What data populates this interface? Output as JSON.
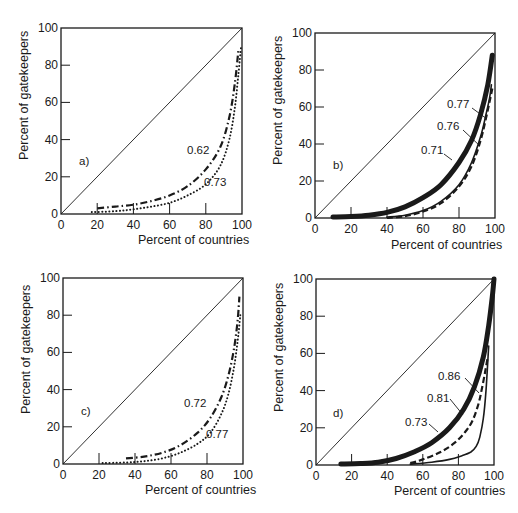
{
  "chart_data": [
    {
      "type": "line",
      "panel_label": "a)",
      "xlabel": "Percent of countries",
      "ylabel": "Percent of gatekeepers",
      "xlim": [
        0,
        100
      ],
      "ylim": [
        0,
        100
      ],
      "xticks": [
        "0",
        "20",
        "40",
        "60",
        "80",
        "100"
      ],
      "yticks": [
        "0",
        "20",
        "40",
        "60",
        "80",
        "100"
      ],
      "grid": false,
      "reference_line": "diagonal y = x (line of equality)",
      "series": [
        {
          "name": "0.62",
          "style": "dash-dot",
          "x": [
            20,
            30,
            40,
            50,
            60,
            70,
            80,
            88,
            93,
            96,
            98
          ],
          "y": [
            3,
            4,
            5,
            7,
            10,
            15,
            24,
            36,
            52,
            70,
            88
          ]
        },
        {
          "name": "0.73",
          "style": "dotted",
          "x": [
            17,
            30,
            40,
            50,
            60,
            70,
            80,
            88,
            93,
            96,
            98,
            99.5
          ],
          "y": [
            1,
            1.5,
            2.5,
            4,
            6,
            10,
            16,
            26,
            40,
            57,
            75,
            90
          ]
        }
      ]
    },
    {
      "type": "line",
      "panel_label": "b)",
      "xlabel": "Percent of countries",
      "ylabel": "Percent of gatekeepers",
      "xlim": [
        0,
        100
      ],
      "ylim": [
        0,
        100
      ],
      "xticks": [
        "0",
        "20",
        "40",
        "60",
        "80",
        "100"
      ],
      "yticks": [
        "0",
        "20",
        "40",
        "60",
        "80",
        "100"
      ],
      "grid": false,
      "reference_line": "diagonal y = x (line of equality)",
      "series": [
        {
          "name": "0.71",
          "style": "thick-solid",
          "x": [
            10,
            20,
            30,
            40,
            50,
            60,
            70,
            80,
            87,
            92,
            96,
            98.5
          ],
          "y": [
            0.5,
            0.8,
            1.5,
            3,
            6,
            11,
            18,
            30,
            42,
            56,
            72,
            88
          ]
        },
        {
          "name": "0.76",
          "style": "thin-solid",
          "x": [
            40,
            50,
            60,
            70,
            80,
            87,
            92,
            95,
            97,
            98
          ],
          "y": [
            0.5,
            1.5,
            4,
            9,
            18,
            30,
            44,
            56,
            65,
            72
          ]
        },
        {
          "name": "0.77",
          "style": "dashed",
          "x": [
            40,
            50,
            60,
            70,
            80,
            87,
            92,
            95,
            97,
            98.5
          ],
          "y": [
            0,
            1,
            3.5,
            8,
            17,
            28,
            42,
            54,
            63,
            70
          ]
        }
      ]
    },
    {
      "type": "line",
      "panel_label": "c)",
      "xlabel": "Percent of countries",
      "ylabel": "Percent of gatekeepers",
      "xlim": [
        0,
        100
      ],
      "ylim": [
        0,
        100
      ],
      "xticks": [
        "0",
        "20",
        "40",
        "60",
        "80",
        "100"
      ],
      "yticks": [
        "0",
        "20",
        "40",
        "60",
        "80",
        "100"
      ],
      "grid": false,
      "reference_line": "diagonal y = x (line of equality)",
      "series": [
        {
          "name": "0.72",
          "style": "dash-dot",
          "x": [
            35,
            45,
            55,
            65,
            75,
            82,
            88,
            92,
            95,
            97,
            98
          ],
          "y": [
            3,
            4,
            6,
            10,
            17,
            25,
            36,
            48,
            62,
            77,
            90
          ]
        },
        {
          "name": "0.77",
          "style": "dotted",
          "x": [
            22,
            35,
            45,
            55,
            65,
            75,
            82,
            88,
            92,
            95,
            97,
            98.5
          ],
          "y": [
            0.5,
            0.8,
            1.5,
            3,
            6,
            11,
            17,
            27,
            38,
            52,
            66,
            80
          ]
        }
      ]
    },
    {
      "type": "line",
      "panel_label": "d)",
      "xlabel": "Percent of countries",
      "ylabel": "Percent of gatekeepers",
      "xlim": [
        0,
        100
      ],
      "ylim": [
        0,
        100
      ],
      "xticks": [
        "0",
        "20",
        "40",
        "60",
        "80",
        "100"
      ],
      "yticks": [
        "0",
        "20",
        "40",
        "60",
        "80",
        "100"
      ],
      "grid": false,
      "reference_line": "diagonal y = x (line of equality)",
      "series": [
        {
          "name": "0.73",
          "style": "thick-solid",
          "x": [
            14,
            25,
            35,
            45,
            55,
            65,
            75,
            83,
            89,
            94,
            97,
            99,
            100
          ],
          "y": [
            0.5,
            0.8,
            1.5,
            3.5,
            7,
            12,
            20,
            30,
            42,
            58,
            75,
            90,
            100
          ]
        },
        {
          "name": "0.81",
          "style": "dashed",
          "x": [
            53,
            60,
            70,
            78,
            84,
            88,
            91,
            93,
            95,
            96.5
          ],
          "y": [
            1,
            3,
            7,
            12,
            18,
            24,
            32,
            40,
            50,
            58
          ]
        },
        {
          "name": "0.86",
          "style": "thin-solid",
          "x": [
            53,
            65,
            75,
            82,
            87,
            90,
            92,
            94,
            95.5,
            97
          ],
          "y": [
            0.5,
            1.5,
            3,
            5,
            7,
            10,
            15,
            25,
            40,
            64
          ]
        }
      ]
    }
  ],
  "panels": [
    {
      "label": "a)",
      "xlabel": "Percent of countries",
      "ylabel": "Percent of gatekeepers",
      "annotations": [
        {
          "text": "0.62"
        },
        {
          "text": "0.73"
        }
      ]
    },
    {
      "label": "b)",
      "xlabel": "Percent of countries",
      "ylabel": "Percent of gatekeepers",
      "annotations": [
        {
          "text": "0.77"
        },
        {
          "text": "0.76"
        },
        {
          "text": "0.71"
        }
      ]
    },
    {
      "label": "c)",
      "xlabel": "Percent of countries",
      "ylabel": "Percent of gatekeepers",
      "annotations": [
        {
          "text": "0.72"
        },
        {
          "text": "0.77"
        }
      ]
    },
    {
      "label": "d)",
      "xlabel": "Percent of countries",
      "ylabel": "Percent of gatekeepers",
      "annotations": [
        {
          "text": "0.86"
        },
        {
          "text": "0.81"
        },
        {
          "text": "0.73"
        }
      ]
    }
  ],
  "ticks": [
    "0",
    "20",
    "40",
    "60",
    "80",
    "100"
  ],
  "colors": {
    "ink": "#1a1a1a",
    "background": "#ffffff"
  }
}
